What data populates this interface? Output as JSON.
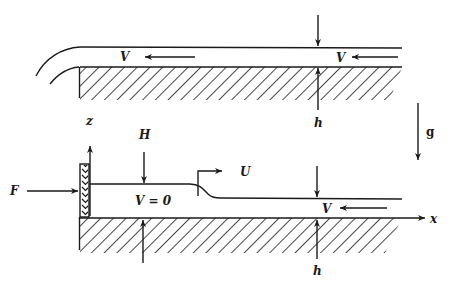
{
  "figure": {
    "type": "fluid-mechanics schematic",
    "background": "#ffffff",
    "ink": "#1a1a1a"
  },
  "top_panel": {
    "description": "Uniform flow of depth h with velocity V over a bed, exiting over an edge at left",
    "labels": {
      "velocity_left": "V",
      "velocity_right": "V",
      "depth": "h"
    }
  },
  "gravity": {
    "label": "g",
    "direction": "down"
  },
  "bottom_panel": {
    "description": "Plate pushed by force F holds still water of depth H; a surge front moves at speed U into oncoming flow of depth h and velocity V",
    "labels": {
      "force": "F",
      "z_axis": "z",
      "x_axis": "x",
      "still_depth": "H",
      "still_velocity": "V = 0",
      "front_speed": "U",
      "velocity": "V",
      "depth": "h"
    }
  }
}
